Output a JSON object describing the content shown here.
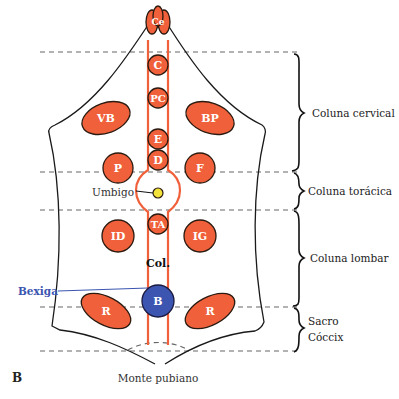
{
  "figure_label": "B",
  "colors": {
    "organ_fill": "#f0603a",
    "bladder_fill": "#3b55b0",
    "bladder_label": "#3b55b0",
    "umbilicus_fill": "#f2e23a",
    "channel_stroke": "#f0603a",
    "outline": "#1a1a1a"
  },
  "organs": {
    "ce": "Ce",
    "c": "C",
    "pc": "PC",
    "vb": "VB",
    "bp": "BP",
    "e": "E",
    "d": "D",
    "p": "P",
    "f": "F",
    "ta": "TA",
    "id": "ID",
    "ig": "IG",
    "col": "Col.",
    "b": "B",
    "r_left": "R",
    "r_right": "R"
  },
  "annotations": {
    "umbigo": "Umbigo",
    "bexiga": "Bexiga",
    "monte_pubiano": "Monte pubiano"
  },
  "regions": [
    {
      "lines": [
        "Coluna cervical"
      ]
    },
    {
      "lines": [
        "Coluna torácica"
      ]
    },
    {
      "lines": [
        "Coluna lombar"
      ]
    },
    {
      "lines": [
        "Sacro",
        "Cóccix"
      ]
    }
  ]
}
